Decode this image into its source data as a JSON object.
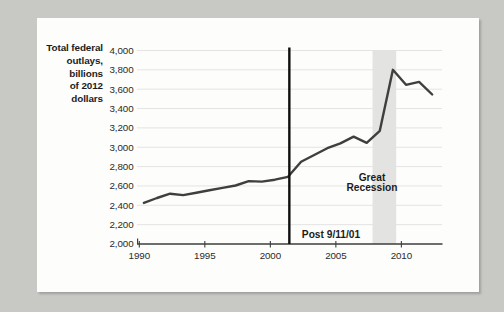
{
  "page": {
    "background_color": "#c8c9c5",
    "card_color": "#fdfdfb"
  },
  "chart_data": {
    "type": "line",
    "title_lines": [
      "Total federal",
      "outlays,",
      "billions",
      "of 2012",
      "dollars"
    ],
    "title": "Total federal outlays, billions of 2012 dollars",
    "series": [
      {
        "name": "Total federal outlays (billions of 2012 dollars)",
        "x": [
          1990,
          1991,
          1992,
          1993,
          1994,
          1995,
          1996,
          1997,
          1998,
          1999,
          2000,
          2001,
          2002,
          2003,
          2004,
          2005,
          2006,
          2007,
          2008,
          2009,
          2010,
          2011,
          2012
        ],
        "values": [
          2425,
          2475,
          2520,
          2505,
          2530,
          2555,
          2580,
          2605,
          2650,
          2645,
          2665,
          2695,
          2850,
          2920,
          2990,
          3040,
          3110,
          3045,
          3170,
          3800,
          3645,
          3675,
          3545
        ]
      }
    ],
    "xlabel": "",
    "ylabel": "",
    "xlim": [
      1989.9,
      2013.1
    ],
    "ylim": [
      2000,
      4000
    ],
    "x_ticks": [
      1990,
      1995,
      2000,
      2005,
      2010
    ],
    "x_tick_labels": [
      "1990",
      "1995",
      "2000",
      "2005",
      "2010"
    ],
    "y_ticks": [
      2000,
      2200,
      2400,
      2600,
      2800,
      3000,
      3200,
      3400,
      3600,
      3800,
      4000
    ],
    "y_tick_labels": [
      "2,000",
      "2,200",
      "2,400",
      "2,600",
      "2,800",
      "3,000",
      "3,200",
      "3,400",
      "3,600",
      "3,800",
      "4,000"
    ],
    "grid": "horizontal",
    "legend": "none",
    "event_line": {
      "x": 2001.45,
      "label": "Post 9/11/01"
    },
    "band": {
      "x0": 2007.8,
      "x1": 2009.6,
      "label_lines": [
        "Great",
        "Recession"
      ],
      "label": "Great Recession"
    },
    "colors": {
      "line": "#3f3f3f",
      "grid": "#e4e4e4",
      "axis": "#3d3d3d",
      "tick_label": "#2b2b2b",
      "event_line": "#0f0f0f",
      "band_fill": "#e3e3e1",
      "annotation_text": "#1c1c1c"
    }
  }
}
